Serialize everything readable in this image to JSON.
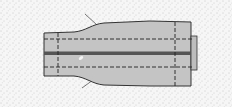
{
  "figure": {
    "colors": {
      "background": "#f6f6f6",
      "stipple": "#9a9a9a",
      "fabric": "#c4c4c4",
      "outline": "#333333",
      "stitch": "#222222",
      "center_band": "#555555",
      "highlight": "#f2f2f2"
    }
  }
}
